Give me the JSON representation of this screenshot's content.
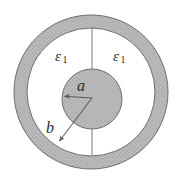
{
  "figure": {
    "kind": "cross-section-diagram",
    "canvas": {
      "width": 182,
      "height": 181,
      "background": "#ffffff"
    },
    "colors": {
      "stipple_fill": "#b9b9b9",
      "stipple_dot": "#8f8f8f",
      "outline": "#5f5f5f",
      "line": "#6a6a6a",
      "label_text": "#2b2b2b"
    },
    "geometry": {
      "center": {
        "x": 91,
        "y": 92
      },
      "outer_shell_outer_radius": 77,
      "outer_shell_inner_radius": 64,
      "inner_disk_center": {
        "x": 92,
        "y": 99
      },
      "inner_disk_radius": 30
    },
    "labels": {
      "dielectric_left": {
        "symbol": "ε",
        "subscript": "1"
      },
      "dielectric_right": {
        "symbol": "ε",
        "subscript": "1"
      },
      "inner_radius": "a",
      "outer_radius": "b"
    },
    "annotations": {
      "radius_a_arrow": {
        "from": {
          "x": 92,
          "y": 98
        },
        "to": {
          "x": 63,
          "y": 96
        },
        "label": "a"
      },
      "radius_b_arrow": {
        "from": {
          "x": 92,
          "y": 98
        },
        "to": {
          "x": 58,
          "y": 143
        },
        "label": "b"
      },
      "vertical_divider_top": {
        "x": 92,
        "y1": 27,
        "y2": 69
      },
      "vertical_divider_bottom": {
        "x": 92,
        "y1": 129,
        "y2": 155
      }
    }
  }
}
